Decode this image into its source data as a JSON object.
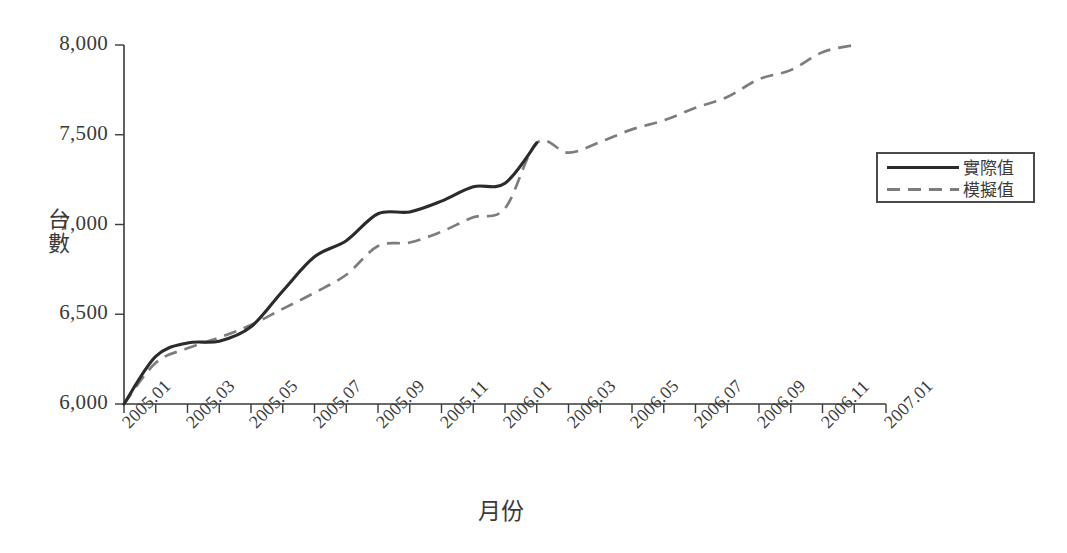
{
  "chart_data": {
    "type": "line",
    "title": "",
    "xlabel": "月份",
    "ylabel": "台數",
    "ylim": [
      6000,
      8000
    ],
    "yticks": [
      6000,
      6500,
      7000,
      7500,
      8000
    ],
    "ytick_labels": [
      "6,000",
      "6,500",
      "7,000",
      "7,500",
      "8,000"
    ],
    "grid": false,
    "legend_position": "right",
    "x": [
      "2005.01",
      "2005.02",
      "2005.03",
      "2005.04",
      "2005.05",
      "2005.06",
      "2005.07",
      "2005.08",
      "2005.09",
      "2005.10",
      "2005.11",
      "2005.12",
      "2006.01",
      "2006.02",
      "2006.03",
      "2006.04",
      "2006.05",
      "2006.06",
      "2006.07",
      "2006.08",
      "2006.09",
      "2006.10",
      "2006.11",
      "2006.12"
    ],
    "xtick_labels": [
      "2005.01",
      "2005.03",
      "2005.05",
      "2005.07",
      "2005.09",
      "2005.11",
      "2006.01",
      "2006.03",
      "2006.05",
      "2006.07",
      "2006.09",
      "2006.11",
      "2007.01"
    ],
    "xtick_every": 2,
    "series": [
      {
        "name": "實際值",
        "style": "solid",
        "color": "#2b2b2b",
        "x": [
          "2005.01",
          "2005.02",
          "2005.03",
          "2005.04",
          "2005.05",
          "2005.06",
          "2005.07",
          "2005.08",
          "2005.09",
          "2005.10",
          "2005.11",
          "2005.12",
          "2006.01",
          "2006.02"
        ],
        "values": [
          6000,
          6265,
          6340,
          6350,
          6430,
          6630,
          6820,
          6910,
          7060,
          7070,
          7130,
          7210,
          7230,
          7455
        ]
      },
      {
        "name": "模擬值",
        "style": "dashed",
        "color": "#7d7d7d",
        "x": [
          "2005.01",
          "2005.02",
          "2005.03",
          "2005.04",
          "2005.05",
          "2005.06",
          "2005.07",
          "2005.08",
          "2005.09",
          "2005.10",
          "2005.11",
          "2005.12",
          "2006.01",
          "2006.02",
          "2006.03",
          "2006.04",
          "2006.05",
          "2006.06",
          "2006.07",
          "2006.08",
          "2006.09",
          "2006.10",
          "2006.11",
          "2006.12"
        ],
        "values": [
          6000,
          6230,
          6310,
          6370,
          6440,
          6530,
          6620,
          6720,
          6880,
          6900,
          6960,
          7040,
          7090,
          7455,
          7400,
          7460,
          7530,
          7580,
          7650,
          7710,
          7810,
          7860,
          7960,
          8000
        ]
      }
    ]
  },
  "legend": {
    "items": [
      {
        "label": "實際值",
        "style": "solid"
      },
      {
        "label": "模擬值",
        "style": "dashed"
      }
    ]
  }
}
